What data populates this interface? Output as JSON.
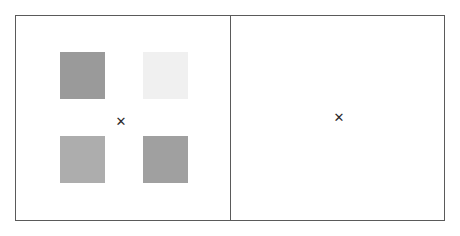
{
  "display": {
    "width": 460,
    "height": 236,
    "background_color": "#ffffff",
    "frame_color": "#5a5a5a"
  },
  "panels": [
    {
      "id": "sample-array-panel",
      "name": "left-panel",
      "x": 15,
      "y": 15,
      "width": 216,
      "height": 206,
      "fixation": {
        "glyph": "✕",
        "x": 121,
        "y": 122,
        "color": "#2b2b2b"
      },
      "items": [
        {
          "name": "square-top-left",
          "color": "#9a9a9a",
          "x": 60,
          "y": 52,
          "width": 45,
          "height": 47
        },
        {
          "name": "square-top-right",
          "color": "#f0f0f0",
          "x": 143,
          "y": 52,
          "width": 45,
          "height": 47
        },
        {
          "name": "square-bottom-left",
          "color": "#adadad",
          "x": 60,
          "y": 136,
          "width": 45,
          "height": 47
        },
        {
          "name": "square-bottom-right",
          "color": "#a0a0a0",
          "x": 143,
          "y": 136,
          "width": 45,
          "height": 47
        }
      ]
    },
    {
      "id": "blank-panel",
      "name": "right-panel",
      "x": 230,
      "y": 15,
      "width": 215,
      "height": 206,
      "fixation": {
        "glyph": "✕",
        "x": 339,
        "y": 118,
        "color": "#2b2b2b"
      },
      "items": []
    }
  ],
  "chart_data": {
    "type": "scatter",
    "title": "",
    "xlabel": "",
    "ylabel": "",
    "series": [
      {
        "name": "left-panel-squares",
        "points": [
          {
            "label": "top-left",
            "x": 82,
            "y": 75,
            "value": "#9a9a9a"
          },
          {
            "label": "top-right",
            "x": 165,
            "y": 75,
            "value": "#f0f0f0"
          },
          {
            "label": "bottom-left",
            "x": 82,
            "y": 159,
            "value": "#adadad"
          },
          {
            "label": "bottom-right",
            "x": 165,
            "y": 159,
            "value": "#a0a0a0"
          }
        ]
      },
      {
        "name": "right-panel-squares",
        "points": []
      }
    ]
  }
}
